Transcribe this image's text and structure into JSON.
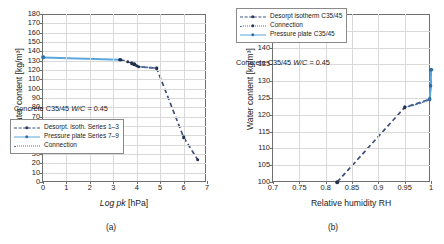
{
  "figure": {
    "panels": [
      {
        "caption": "(a)",
        "annotation": "Concrete C35/45 W/C = 0.45",
        "annotation_plain": "Concrete C35/45 ",
        "annotation_italic": "W/C",
        "annotation_tail": " = 0.45",
        "legend": [
          {
            "label": "Desorpt. isoth. Series 1–3",
            "style": "dashed-marker",
            "color": "#3f4f7a"
          },
          {
            "label": "Pressure plate Series 7–9",
            "style": "solid-marker",
            "color": "#5aa8dd"
          },
          {
            "label": "Connection",
            "style": "dotted",
            "color": "#4f6fa8"
          }
        ]
      },
      {
        "caption": "(b)",
        "annotation": "Concrete C35/45 W/C = 0.45",
        "annotation_plain": "Concrete C35/45 ",
        "annotation_italic": "W/C",
        "annotation_tail": " = 0.45",
        "legend": [
          {
            "label": "Desorpt isotherm C35/45",
            "style": "dashed-marker",
            "color": "#3f4f7a"
          },
          {
            "label": "Connection",
            "style": "dotted-marker",
            "color": "#4f6fa8"
          },
          {
            "label": "Pressure plate C35/45",
            "style": "solid-marker",
            "color": "#5aa8dd"
          }
        ]
      }
    ]
  },
  "chart_data": [
    {
      "type": "line",
      "title": "",
      "panel": "(a)",
      "xlabel": "Log pk [hPa]",
      "xlabel_italic": "Log pk",
      "xlabel_tail": " [hPa]",
      "ylabel": "Water content [kg/m³]",
      "xlim": [
        0,
        7
      ],
      "ylim": [
        0,
        180
      ],
      "xticks": [
        0,
        1,
        2,
        3,
        4,
        5,
        6,
        7
      ],
      "yticks": [
        0,
        10,
        20,
        30,
        40,
        50,
        60,
        70,
        80,
        90,
        100,
        110,
        120,
        130,
        140,
        150,
        160,
        170,
        180
      ],
      "grid": true,
      "legend_position": "lower-left",
      "series": [
        {
          "name": "Pressure plate Series 7–9",
          "style": "solid",
          "color": "#5aa8dd",
          "x": [
            0.0,
            3.3
          ],
          "y": [
            133.5,
            131.0
          ]
        },
        {
          "name": "Desorpt. isoth. Series 1–3",
          "style": "dashed",
          "color": "#3f4f7a",
          "x": [
            3.3,
            3.62,
            3.78,
            3.9,
            4.0,
            4.08,
            4.85,
            6.0,
            6.6
          ],
          "y": [
            131.0,
            129.0,
            127.5,
            126.0,
            124.5,
            123.5,
            122.0,
            48.0,
            24.0
          ]
        },
        {
          "name": "Connection",
          "style": "dotted",
          "color": "#4f6fa8",
          "x": [
            4.08,
            4.35,
            4.6,
            4.85
          ],
          "y": [
            123.5,
            123.0,
            122.5,
            122.0
          ]
        }
      ]
    },
    {
      "type": "line",
      "title": "",
      "panel": "(b)",
      "xlabel": "Relative humidity RH",
      "ylabel": "Water content [kg/m³]",
      "xlim": [
        0.7,
        1.0
      ],
      "ylim": [
        100,
        150
      ],
      "xticks": [
        0.7,
        0.75,
        0.8,
        0.85,
        0.9,
        0.95,
        1
      ],
      "xtick_labels": [
        "0.7",
        "0.75",
        "0.8",
        "0.85",
        "0.9",
        "0.95",
        "1"
      ],
      "yticks": [
        100,
        105,
        110,
        115,
        120,
        125,
        130,
        135,
        140,
        145,
        150
      ],
      "grid": true,
      "legend_position": "upper-left",
      "series": [
        {
          "name": "Desorpt isotherm C35/45",
          "style": "dashed",
          "color": "#3f4f7a",
          "x": [
            0.822,
            0.95,
            0.9975,
            0.9995,
            1.0
          ],
          "y": [
            100.0,
            122.2,
            124.6,
            128.6,
            133.4
          ]
        },
        {
          "name": "Connection",
          "style": "dotted",
          "color": "#4f6fa8",
          "x": [
            0.95,
            0.965,
            0.98,
            0.9975
          ],
          "y": [
            122.2,
            122.8,
            123.5,
            124.6
          ]
        },
        {
          "name": "Pressure plate C35/45",
          "style": "solid",
          "color": "#5aa8dd",
          "x": [
            0.9975,
            0.9995,
            1.0
          ],
          "y": [
            124.6,
            128.6,
            133.4
          ]
        }
      ]
    }
  ]
}
